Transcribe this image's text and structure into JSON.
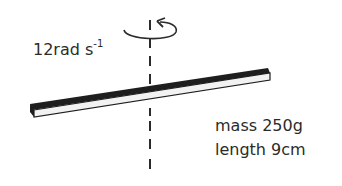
{
  "diagram": {
    "angular_velocity": {
      "value": "12rad s",
      "exponent": "-1"
    },
    "rod": {
      "mass_label": "mass 250g",
      "length_label": "length 9cm"
    },
    "icons": {
      "rotation": "rotation-arrow-icon",
      "axis": "dashed-axis"
    },
    "colors": {
      "stroke": "#2b2b2b",
      "rod_face": "#f4f4f4",
      "background": "#ffffff"
    }
  }
}
